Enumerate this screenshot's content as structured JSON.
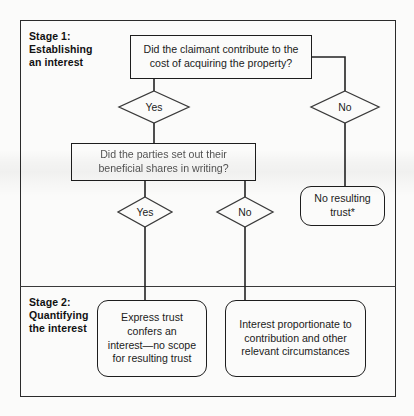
{
  "stages": {
    "stage1": {
      "label": "Stage 1:\nEstablishing\nan interest"
    },
    "stage2": {
      "label": "Stage 2:\nQuantifying\nthe interest"
    }
  },
  "nodes": {
    "q1": {
      "id": "q1",
      "shape": "rectangle",
      "text": "Did the claimant contribute to the\ncost of acquiring the property?"
    },
    "q2": {
      "id": "q2",
      "shape": "rectangle",
      "text": "Did the parties set out their\nbeneficial shares in writing?"
    },
    "no_resulting_trust": {
      "id": "no_resulting_trust",
      "shape": "rounded-rectangle",
      "text": "No resulting\ntrust*"
    },
    "express_trust": {
      "id": "express_trust",
      "shape": "rounded-rectangle",
      "text": "Express trust\nconfers an\ninterest—no scope\nfor resulting trust"
    },
    "proportionate_interest": {
      "id": "proportionate_interest",
      "shape": "rounded-rectangle",
      "text": "Interest proportionate to\ncontribution and other\nrelevant circumstances"
    }
  },
  "decisions": {
    "yes1": {
      "id": "yes1",
      "shape": "diamond",
      "label": "Yes"
    },
    "no1": {
      "id": "no1",
      "shape": "diamond",
      "label": "No"
    },
    "yes2": {
      "id": "yes2",
      "shape": "diamond",
      "label": "Yes"
    },
    "no2": {
      "id": "no2",
      "shape": "diamond",
      "label": "No"
    }
  },
  "edges": [
    {
      "from": "q1",
      "to": "yes1",
      "label": "Yes"
    },
    {
      "from": "q1",
      "to": "no1",
      "label": "No"
    },
    {
      "from": "yes1",
      "to": "q2",
      "label": ""
    },
    {
      "from": "no1",
      "to": "no_resulting_trust",
      "label": ""
    },
    {
      "from": "q2",
      "to": "yes2",
      "label": "Yes"
    },
    {
      "from": "q2",
      "to": "no2",
      "label": "No"
    },
    {
      "from": "yes2",
      "to": "express_trust",
      "label": ""
    },
    {
      "from": "no2",
      "to": "proportionate_interest",
      "label": ""
    }
  ],
  "colors": {
    "stroke": "#1d1d1d",
    "frame": "#2b2b2b",
    "text": "#1b1b1b",
    "background": "#fbfbfa"
  }
}
